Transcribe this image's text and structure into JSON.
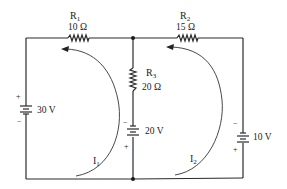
{
  "diagram": {
    "type": "circuit-schematic",
    "colors": {
      "wire": "#2a2a2a",
      "text": "#222222",
      "background": "#ffffff"
    },
    "resistors": [
      {
        "id": "R1",
        "name": "R",
        "sub": "1",
        "value": "10 Ω"
      },
      {
        "id": "R2",
        "name": "R",
        "sub": "2",
        "value": "15 Ω"
      },
      {
        "id": "R3",
        "name": "R",
        "sub": "3",
        "value": "20 Ω"
      }
    ],
    "sources": [
      {
        "id": "V1",
        "label": "30 V",
        "plus": "+",
        "minus": "−"
      },
      {
        "id": "V2",
        "label": "20 V",
        "plus": "+",
        "minus": "−"
      },
      {
        "id": "V3",
        "label": "10 V",
        "plus": "+",
        "minus": "−"
      }
    ],
    "loops": [
      {
        "id": "I1",
        "name": "I",
        "sub": "1"
      },
      {
        "id": "I2",
        "name": "I",
        "sub": "2"
      }
    ]
  }
}
